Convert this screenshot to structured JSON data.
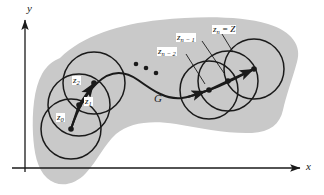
{
  "figure": {
    "background_color": "#ffffff",
    "ink_color": "#1a1a1a",
    "region_fill_color": "#c9c9c9",
    "region_label": "G",
    "axes": {
      "x_label": "x",
      "y_label": "y",
      "origin": {
        "x": 25,
        "y": 168
      }
    },
    "ellipsis": {
      "name": "ellipsis-dots",
      "dots": [
        {
          "cx": 136,
          "cy": 64
        },
        {
          "cx": 146,
          "cy": 68
        },
        {
          "cx": 156,
          "cy": 73
        }
      ]
    },
    "points": [
      {
        "id": "z0",
        "label": "z",
        "sub": "0",
        "eq": "",
        "cx": 71,
        "cy": 129,
        "label_x": 56,
        "label_y": 113
      },
      {
        "id": "z1",
        "label": "z",
        "sub": "1",
        "eq": "",
        "cx": 79,
        "cy": 105,
        "label_x": 84,
        "label_y": 97
      },
      {
        "id": "z2",
        "label": "z",
        "sub": "2",
        "eq": "",
        "cx": 94,
        "cy": 83,
        "label_x": 72,
        "label_y": 76
      },
      {
        "id": "zn2",
        "label": "z",
        "sub": "n − 2",
        "eq": "",
        "cx": 209,
        "cy": 90,
        "label_x": 157,
        "label_y": 47
      },
      {
        "id": "zn1",
        "label": "z",
        "sub": "n − 1",
        "eq": "",
        "cx": 228,
        "cy": 81,
        "label_x": 176,
        "label_y": 33
      },
      {
        "id": "zn",
        "label": "z",
        "sub": "n",
        "eq": " = Z",
        "cx": 254,
        "cy": 69,
        "label_x": 212,
        "label_y": 25
      }
    ],
    "disks": [
      {
        "name": "disk-z0",
        "cx": 71,
        "cy": 129,
        "r": 30
      },
      {
        "name": "disk-z1",
        "cx": 79,
        "cy": 105,
        "r": 31
      },
      {
        "name": "disk-z2",
        "cx": 94,
        "cy": 83,
        "r": 31
      },
      {
        "name": "disk-zn2",
        "cx": 209,
        "cy": 90,
        "r": 29
      },
      {
        "name": "disk-zn1",
        "cx": 228,
        "cy": 81,
        "r": 30
      },
      {
        "name": "disk-zn",
        "cx": 254,
        "cy": 69,
        "r": 30
      }
    ],
    "curve_name": "curve-C",
    "chain_left_name": "chain-polyline-left",
    "chain_right_name": "chain-polyline-right"
  }
}
